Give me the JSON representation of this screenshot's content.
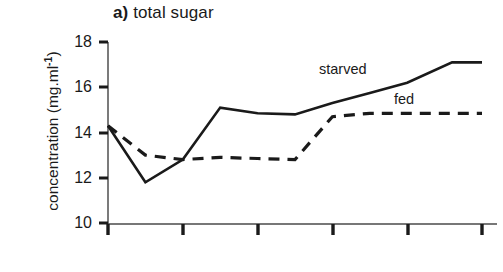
{
  "figure": {
    "panel_tag": "a)",
    "panel_title": "total sugar",
    "background_color": "#ffffff",
    "ink_color": "#1a1a1a"
  },
  "axes": {
    "y_axis_title_text": "concentration (mg.ml",
    "y_axis_title_exponent": "-1",
    "y_axis_title_close": ")",
    "y_tick_labels": [
      "18",
      "16",
      "14",
      "12",
      "10"
    ],
    "x_tick_labels": [
      "",
      "",
      "",
      "",
      "",
      ""
    ]
  },
  "legend": {
    "starved_label": "starved",
    "fed_label": "fed"
  },
  "chart_data": {
    "type": "line",
    "title": "a) total sugar",
    "xlabel": "",
    "ylabel": "concentration (mg.ml-1)",
    "ylim": [
      10,
      18
    ],
    "yticks": [
      10,
      12,
      14,
      16,
      18
    ],
    "xlim": [
      0,
      5
    ],
    "xticks": [
      0,
      1,
      2,
      3,
      4,
      5
    ],
    "xticklabels": [
      "",
      "",
      "",
      "",
      "",
      ""
    ],
    "grid": false,
    "legend_position": "inline-annotations",
    "x": [
      0,
      0.5,
      1,
      1.5,
      2,
      2.5,
      3,
      3.5,
      4,
      4.6,
      5
    ],
    "series": [
      {
        "name": "starved",
        "style": "solid",
        "color": "#1a1a1a",
        "values": [
          14.3,
          11.8,
          12.8,
          15.1,
          14.85,
          14.8,
          15.3,
          15.75,
          16.2,
          17.1,
          17.1
        ]
      },
      {
        "name": "fed",
        "style": "dashed",
        "color": "#1a1a1a",
        "values": [
          14.3,
          13.0,
          12.8,
          12.9,
          12.85,
          12.8,
          14.7,
          14.85,
          14.85,
          14.85,
          14.85
        ]
      }
    ]
  },
  "geometry": {
    "axis_x_px": 108,
    "axis_y_bottom_px": 224,
    "axis_y_top_px": 42,
    "x_tick_px": [
      108,
      183,
      258,
      333,
      408,
      482
    ],
    "y_tick_px": [
      42,
      87,
      133,
      178,
      223
    ],
    "starved_points_px": "108,127 145,183 183,168 220,110 258,117 333,116 408,96 455,68 497,68",
    "fed_points_px": "108,127 145,155 183,162 220,160 258,162 333,118 345,115 497,115"
  }
}
